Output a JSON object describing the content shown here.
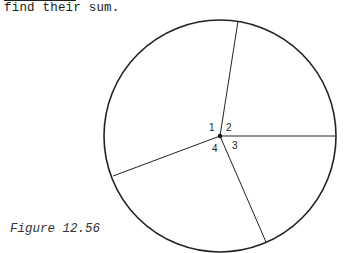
{
  "text": {
    "line": "find their sum."
  },
  "figure": {
    "caption": "Figure 12.56",
    "angle_labels": [
      "1",
      "2",
      "3",
      "4"
    ]
  }
}
